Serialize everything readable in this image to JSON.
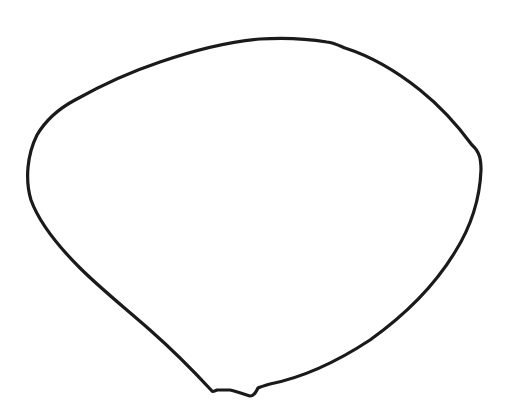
{
  "drawing": {
    "subject": "hand-drawn petal outline",
    "stroke_color": "#1a1a1a",
    "stroke_width": 3.2,
    "background": "#ffffff"
  }
}
